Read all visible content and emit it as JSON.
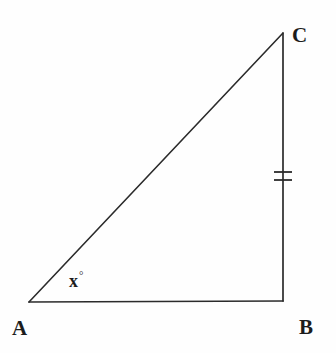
{
  "figure": {
    "kind": "geometry-diagram",
    "shape": "right-triangle",
    "background_color": "#fefefe",
    "stroke_color": "#2b2b2b",
    "width": 336,
    "height": 353
  },
  "vertices": [
    {
      "name": "A",
      "label": "A",
      "x": 29,
      "y": 302
    },
    {
      "name": "B",
      "label": "B",
      "x": 283,
      "y": 301
    },
    {
      "name": "C",
      "label": "C",
      "x": 283,
      "y": 33
    }
  ],
  "labels": {
    "vertex_a": "A",
    "vertex_b": "B",
    "vertex_c": "C",
    "angle_at_a_value": "x",
    "angle_at_a_degree_symbol": "°"
  },
  "sides": [
    {
      "name": "AB",
      "from": "A",
      "to": "B",
      "tick_marks": 0
    },
    {
      "name": "BC",
      "from": "B",
      "to": "C",
      "tick_marks": 2
    },
    {
      "name": "CA",
      "from": "C",
      "to": "A",
      "tick_marks": 0
    }
  ],
  "tick_marks": {
    "side": "BC",
    "count": 2,
    "x_start": 274,
    "x_end": 292,
    "y_positions": [
      172,
      180
    ]
  },
  "chart_data": {
    "type": "diagram",
    "title": "",
    "shape": "right triangle ABC",
    "points": [
      {
        "label": "A",
        "x": 29,
        "y": 302
      },
      {
        "label": "B",
        "x": 283,
        "y": 301
      },
      {
        "label": "C",
        "x": 283,
        "y": 33
      }
    ],
    "edges": [
      {
        "from": "A",
        "to": "B",
        "marks": 0
      },
      {
        "from": "B",
        "to": "C",
        "marks": 2
      },
      {
        "from": "C",
        "to": "A",
        "marks": 0
      }
    ],
    "annotations": [
      {
        "text": "x°",
        "near": "A",
        "x": 72,
        "y": 278,
        "meaning": "unknown angle at vertex A"
      }
    ]
  }
}
